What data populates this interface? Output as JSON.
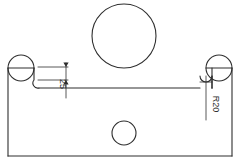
{
  "drawing": {
    "type": "engineering-part-outline-2d",
    "canvas": {
      "width": 238,
      "height": 168,
      "background": "#ffffff"
    },
    "style": {
      "line_color": "#2e2e2e",
      "dimension_color": "#2e2e2e",
      "line_width": 1.1,
      "dimension_line_width": 0.9
    },
    "annotations": {
      "depth_dimension": {
        "label": "25",
        "rotation_deg": 90,
        "x": 60,
        "y": 84
      },
      "radius_callout": {
        "label": "R20",
        "rotation_deg": 90,
        "x": 212,
        "y": 104
      }
    },
    "features": {
      "outer_body": {
        "name": "outer-profile",
        "left_edge_x": 8,
        "right_edge_x": 232,
        "bottom_edge_y": 156,
        "shoulder_top_y": 68,
        "recess_top_y": 88
      },
      "large_circle": {
        "name": "large-bore",
        "cx": 124,
        "cy": 36,
        "r": 32
      },
      "small_circle": {
        "name": "small-bore",
        "cx": 124,
        "cy": 133,
        "r": 12
      },
      "left_boss_circle": {
        "name": "left-corner-radius",
        "cx": 21,
        "cy": 68,
        "r": 13
      },
      "right_boss_circle": {
        "name": "right-corner-radius",
        "cx": 219,
        "cy": 68,
        "r": 13
      },
      "left_fillet": {
        "name": "left-fillet-arc",
        "cx": 30,
        "cy": 84,
        "r": 5
      },
      "right_fillet": {
        "name": "right-fillet-arc",
        "cx": 206,
        "cy": 84,
        "r": 6
      }
    }
  }
}
